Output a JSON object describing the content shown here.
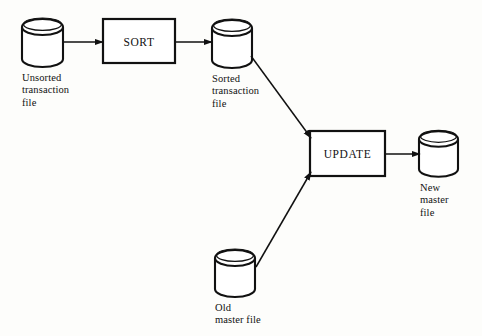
{
  "diagram": {
    "type": "flowchart",
    "stroke_color": "#111111",
    "background_color": "#fdfdfb",
    "nodes": [
      {
        "id": "unsorted-transaction-file",
        "shape": "cylinder",
        "label": "Unsorted\ntransaction\nfile",
        "label_lines": [
          "Unsorted",
          "transaction",
          "file"
        ],
        "x": 22,
        "y": 19,
        "width": 41,
        "height": 48
      },
      {
        "id": "sort-process",
        "shape": "rectangle",
        "label": "SORT",
        "x": 103,
        "y": 19,
        "width": 72,
        "height": 44
      },
      {
        "id": "sorted-transaction-file",
        "shape": "cylinder",
        "label": "Sorted\ntransaction\nfile",
        "label_lines": [
          "Sorted",
          "transaction",
          "file"
        ],
        "x": 212,
        "y": 20,
        "width": 40,
        "height": 48
      },
      {
        "id": "update-process",
        "shape": "rectangle",
        "label": "UPDATE",
        "x": 310,
        "y": 131,
        "width": 75,
        "height": 45
      },
      {
        "id": "new-master-file",
        "shape": "cylinder",
        "label": "New\nmaster\nfile",
        "label_lines": [
          "New",
          "master",
          "file"
        ],
        "x": 419,
        "y": 131,
        "width": 39,
        "height": 46
      },
      {
        "id": "old-master-file",
        "shape": "cylinder",
        "label": "Old\nmaster file",
        "label_lines": [
          "Old",
          "master file"
        ],
        "x": 215,
        "y": 250,
        "width": 40,
        "height": 47
      }
    ],
    "edges": [
      {
        "id": "edge-unsorted-to-sort",
        "from": "unsorted-transaction-file",
        "to": "sort-process",
        "style": "straight-horizontal"
      },
      {
        "id": "edge-sort-to-sorted",
        "from": "sort-process",
        "to": "sorted-transaction-file",
        "style": "straight-horizontal"
      },
      {
        "id": "edge-sorted-to-update",
        "from": "sorted-transaction-file",
        "to": "update-process",
        "style": "diagonal"
      },
      {
        "id": "edge-oldmaster-to-update",
        "from": "old-master-file",
        "to": "update-process",
        "style": "diagonal"
      },
      {
        "id": "edge-update-to-newmaster",
        "from": "update-process",
        "to": "new-master-file",
        "style": "straight-horizontal"
      }
    ]
  }
}
